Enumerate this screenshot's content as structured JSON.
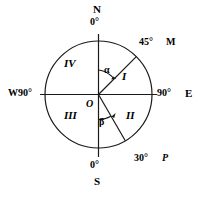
{
  "figure": {
    "stroke_color": "#1a1a1a",
    "background_color": "#ffffff",
    "geometry": {
      "center_x": 98.5,
      "center_y": 94.5,
      "radius": 53.5
    },
    "cardinals": {
      "north_label": "N",
      "north_degree": "0°",
      "south_label": "S",
      "south_degree": "0°",
      "west_label": "W90°",
      "east_degree": "90°",
      "east_label": "E"
    },
    "rays": [
      {
        "name": "OM",
        "degree_label": "45°",
        "point_label": "M",
        "bearing_from_north_deg": 45
      },
      {
        "name": "OP",
        "degree_label": "30°",
        "point_label": "P",
        "bearing_from_south_deg": 30
      }
    ],
    "quadrants": [
      {
        "id": "I",
        "label": "I"
      },
      {
        "id": "II",
        "label": "II"
      },
      {
        "id": "III",
        "label": "III"
      },
      {
        "id": "IV",
        "label": "IV"
      }
    ],
    "angles": [
      {
        "name": "alpha",
        "label": "α",
        "from": "N",
        "to": "M"
      },
      {
        "name": "beta",
        "label": "β",
        "from": "S",
        "to": "P"
      }
    ],
    "center_point_label": "O"
  }
}
